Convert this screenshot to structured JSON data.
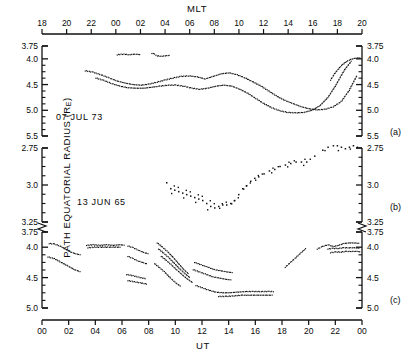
{
  "figure": {
    "top_axis_title": "MLT",
    "bottom_axis_title": "UT",
    "y_axis_title_main": "PATH EQUATORIAL RADIUS (R",
    "y_axis_title_sub": "E",
    "y_axis_title_tail": ")"
  },
  "panels": [
    {
      "tag": "(a)",
      "annotation": "07 JUL 73"
    },
    {
      "tag": "(b)",
      "annotation": "13 JUN 65"
    },
    {
      "tag": "(c)",
      "annotation": ""
    }
  ],
  "chart_data": {
    "type": "scatter",
    "title": "",
    "xlabel": "UT",
    "xlabel_top": "MLT",
    "ylabel": "PATH EQUATORIAL RADIUS (RE)",
    "grid": false,
    "legend": "none",
    "top_axis": {
      "label": "MLT",
      "ticks": [
        "18",
        "20",
        "22",
        "00",
        "02",
        "04",
        "06",
        "08",
        "10",
        "12",
        "14",
        "16",
        "18",
        "20"
      ],
      "range": [
        18,
        44
      ]
    },
    "bottom_axis": {
      "label": "UT",
      "ticks": [
        "00",
        "02",
        "04",
        "06",
        "08",
        "10",
        "12",
        "14",
        "16",
        "18",
        "20",
        "22",
        "00"
      ],
      "range": [
        0,
        24
      ]
    },
    "subplots": [
      {
        "tag": "(a)",
        "annotation": "07 JUL 73",
        "ylim": [
          5.5,
          3.75
        ],
        "yticks": [
          3.75,
          4.0,
          4.5,
          5.0,
          5.5
        ],
        "ytick_labels": [
          "3.75",
          "4.0",
          "4.5",
          "5.0",
          "5.5"
        ],
        "yminor": [
          4.125,
          4.25,
          4.375,
          4.625,
          4.75,
          4.875,
          5.125,
          5.25,
          5.375
        ],
        "series": [
          {
            "name": "upper-fragment-1",
            "x": [
              5.6,
              5.9,
              6.2,
              6.5,
              6.8,
              7.1,
              7.4
            ],
            "y": [
              3.91,
              3.9,
              3.9,
              3.91,
              3.9,
              3.9,
              3.91
            ]
          },
          {
            "name": "upper-fragment-2",
            "x": [
              8.2,
              8.4,
              8.6,
              8.9,
              9.2,
              9.6
            ],
            "y": [
              3.88,
              3.9,
              3.93,
              3.94,
              3.93,
              3.92
            ]
          },
          {
            "name": "main-trace-upper",
            "x": [
              3.2,
              3.8,
              4.4,
              5.0,
              5.6,
              6.2,
              6.8,
              7.4,
              8.0,
              8.6,
              9.2,
              9.8,
              10.4,
              11.0,
              11.6,
              12.2,
              12.8,
              13.4,
              14.0,
              14.6,
              15.2,
              15.8,
              16.4,
              17.0,
              17.6,
              18.2,
              18.8,
              19.4,
              20.0,
              20.6,
              21.2,
              21.8,
              22.4,
              23.0,
              23.6
            ],
            "y": [
              4.22,
              4.25,
              4.3,
              4.36,
              4.42,
              4.46,
              4.49,
              4.5,
              4.48,
              4.44,
              4.4,
              4.36,
              4.33,
              4.32,
              4.34,
              4.38,
              4.33,
              4.28,
              4.26,
              4.3,
              4.36,
              4.44,
              4.52,
              4.62,
              4.72,
              4.8,
              4.86,
              4.92,
              4.96,
              4.98,
              4.97,
              4.92,
              4.82,
              4.6,
              4.3
            ]
          },
          {
            "name": "main-trace-lower",
            "x": [
              4.0,
              4.6,
              5.2,
              5.8,
              6.4,
              7.0,
              7.6,
              8.2,
              8.8,
              9.4,
              10.0,
              10.6,
              11.2,
              11.8,
              12.4,
              13.0,
              13.6,
              14.2,
              14.8,
              15.4,
              16.0,
              16.6,
              17.2,
              17.8,
              18.4,
              19.0,
              19.6,
              20.2,
              20.8,
              21.4,
              22.0,
              22.6,
              23.2
            ],
            "y": [
              4.36,
              4.41,
              4.47,
              4.52,
              4.55,
              4.56,
              4.56,
              4.54,
              4.52,
              4.5,
              4.5,
              4.52,
              4.56,
              4.58,
              4.56,
              4.52,
              4.5,
              4.52,
              4.58,
              4.66,
              4.76,
              4.86,
              4.94,
              5.0,
              5.03,
              5.04,
              5.03,
              4.99,
              4.9,
              4.74,
              4.5,
              4.22,
              4.02
            ]
          },
          {
            "name": "late-rise-cluster",
            "x": [
              21.6,
              21.9,
              22.2,
              22.5,
              22.8,
              23.1,
              23.4,
              23.7,
              23.9
            ],
            "y": [
              4.4,
              4.28,
              4.18,
              4.1,
              4.04,
              4.0,
              3.98,
              3.97,
              3.98
            ]
          }
        ]
      },
      {
        "tag": "(b)",
        "annotation": "13 JUN 65",
        "ylim": [
          3.25,
          2.75
        ],
        "yticks": [
          2.75,
          3.0,
          3.25
        ],
        "ytick_labels": [
          "2.75",
          "3.0",
          "3.25"
        ],
        "yminor": [
          2.8125,
          2.875,
          2.9375,
          3.0625,
          3.125,
          3.1875
        ],
        "series": [
          {
            "name": "scatter-cloud",
            "x": [
              9.3,
              9.6,
              9.9,
              10.2,
              10.5,
              10.8,
              11.1,
              11.4,
              11.7,
              12.0,
              12.3,
              12.6,
              12.9,
              13.2,
              13.5,
              13.8,
              14.1,
              14.4,
              14.7,
              15.0,
              15.3,
              15.6,
              15.9,
              16.2,
              16.6,
              17.0,
              17.4,
              17.8,
              18.2,
              18.6,
              19.0,
              19.4,
              19.8,
              20.4,
              21.0,
              21.4,
              21.8,
              22.1,
              22.4,
              22.7,
              23.0,
              23.3,
              23.6
            ],
            "y": [
              2.98,
              3.02,
              3.03,
              3.04,
              3.05,
              3.06,
              3.07,
              3.08,
              3.09,
              3.1,
              3.12,
              3.14,
              3.15,
              3.14,
              3.13,
              3.13,
              3.12,
              3.1,
              3.06,
              3.02,
              3.0,
              2.97,
              2.95,
              2.94,
              2.92,
              2.9,
              2.89,
              2.87,
              2.86,
              2.85,
              2.84,
              2.84,
              2.84,
              2.8,
              2.76,
              2.74,
              2.73,
              2.73,
              2.74,
              2.75,
              2.74,
              2.73,
              2.74
            ]
          }
        ]
      },
      {
        "tag": "(c)",
        "annotation": "",
        "ylim": [
          5.0,
          3.75
        ],
        "yticks": [
          3.75,
          4.0,
          4.5,
          5.0
        ],
        "ytick_labels": [
          "3.75",
          "4.0",
          "4.5",
          "5.0"
        ],
        "yminor": [
          4.125,
          4.25,
          4.375,
          4.625,
          4.75,
          4.875
        ],
        "series": [
          {
            "name": "seg-a-upper",
            "x": [
              0.5,
              0.9,
              1.3,
              1.7,
              2.1,
              2.5,
              2.9
            ],
            "y": [
              3.93,
              3.94,
              3.97,
              4.02,
              4.07,
              4.1,
              4.12
            ]
          },
          {
            "name": "seg-a-lower",
            "x": [
              0.4,
              0.9,
              1.4,
              1.9,
              2.4,
              2.9
            ],
            "y": [
              4.15,
              4.18,
              4.24,
              4.3,
              4.36,
              4.4
            ]
          },
          {
            "name": "seg-b-flat",
            "x": [
              3.3,
              3.8,
              4.3,
              4.8,
              5.3,
              5.8,
              6.2
            ],
            "y": [
              3.96,
              3.95,
              3.96,
              3.95,
              3.96,
              3.95,
              3.96
            ]
          },
          {
            "name": "seg-b-mid",
            "x": [
              3.4,
              3.9,
              4.4,
              4.9,
              5.4,
              5.9
            ],
            "y": [
              4.0,
              3.99,
              3.99,
              3.99,
              3.99,
              3.99
            ]
          },
          {
            "name": "seg-c-upper",
            "x": [
              6.4,
              6.8,
              7.2,
              7.6,
              8.0
            ],
            "y": [
              3.97,
              4.0,
              4.04,
              4.08,
              4.1
            ]
          },
          {
            "name": "seg-c-mid",
            "x": [
              6.4,
              6.8,
              7.2,
              7.6,
              7.9
            ],
            "y": [
              4.14,
              4.18,
              4.22,
              4.25,
              4.27
            ]
          },
          {
            "name": "seg-c-lower",
            "x": [
              6.3,
              6.8,
              7.3,
              7.8
            ],
            "y": [
              4.44,
              4.46,
              4.49,
              4.51
            ]
          },
          {
            "name": "seg-c-lower2",
            "x": [
              6.4,
              6.9,
              7.4,
              7.9
            ],
            "y": [
              4.54,
              4.56,
              4.58,
              4.6
            ]
          },
          {
            "name": "seg-d-1",
            "x": [
              8.6,
              9.0,
              9.4,
              9.8,
              10.2,
              10.6,
              11.0
            ],
            "y": [
              3.92,
              3.99,
              4.07,
              4.16,
              4.26,
              4.36,
              4.44
            ]
          },
          {
            "name": "seg-d-2",
            "x": [
              8.7,
              9.1,
              9.5,
              9.9,
              10.3,
              10.7,
              11.1
            ],
            "y": [
              4.02,
              4.09,
              4.17,
              4.26,
              4.35,
              4.43,
              4.5
            ]
          },
          {
            "name": "seg-d-3",
            "x": [
              8.9,
              9.3,
              9.7,
              10.1,
              10.5,
              10.9,
              11.3
            ],
            "y": [
              4.14,
              4.21,
              4.29,
              4.37,
              4.45,
              4.52,
              4.58
            ]
          },
          {
            "name": "seg-d-4",
            "x": [
              8.4,
              8.8,
              9.2,
              9.6,
              10.0,
              10.4
            ],
            "y": [
              4.26,
              4.33,
              4.41,
              4.5,
              4.58,
              4.64
            ]
          },
          {
            "name": "seg-e-upper",
            "x": [
              11.4,
              11.9,
              12.4,
              12.9,
              13.4,
              13.9,
              14.3
            ],
            "y": [
              4.24,
              4.28,
              4.32,
              4.36,
              4.38,
              4.4,
              4.41
            ]
          },
          {
            "name": "seg-e-mid",
            "x": [
              11.3,
              11.8,
              12.3,
              12.8,
              13.3,
              13.8,
              14.2
            ],
            "y": [
              4.36,
              4.4,
              4.44,
              4.48,
              4.5,
              4.52,
              4.53
            ]
          },
          {
            "name": "seg-e-low",
            "x": [
              11.5,
              12.0,
              12.5,
              13.0,
              13.5,
              14.0,
              14.6,
              15.2,
              15.8,
              16.4,
              17.0,
              17.4
            ],
            "y": [
              4.62,
              4.66,
              4.7,
              4.73,
              4.74,
              4.74,
              4.73,
              4.72,
              4.72,
              4.72,
              4.72,
              4.72
            ]
          },
          {
            "name": "seg-e-low2",
            "x": [
              13.2,
              13.8,
              14.4,
              15.0,
              15.6,
              16.2,
              16.8,
              17.3
            ],
            "y": [
              4.8,
              4.8,
              4.79,
              4.78,
              4.78,
              4.78,
              4.78,
              4.78
            ]
          },
          {
            "name": "seg-f-rise",
            "x": [
              18.2,
              18.6,
              19.0,
              19.4,
              19.8
            ],
            "y": [
              4.32,
              4.24,
              4.16,
              4.08,
              4.0
            ]
          },
          {
            "name": "seg-g-upper",
            "x": [
              20.6,
              21.0,
              21.4,
              21.8,
              22.2,
              22.6,
              23.0,
              23.4,
              23.8
            ],
            "y": [
              4.02,
              3.98,
              3.95,
              3.98,
              3.96,
              3.93,
              3.92,
              3.92,
              3.93
            ]
          },
          {
            "name": "seg-g-mid",
            "x": [
              21.4,
              21.8,
              22.2,
              22.6,
              23.0,
              23.4,
              23.8
            ],
            "y": [
              4.02,
              4.01,
              4.01,
              4.0,
              4.0,
              4.0,
              4.01
            ]
          },
          {
            "name": "seg-g-low",
            "x": [
              21.6,
              22.0,
              22.4,
              22.8,
              23.2,
              23.6,
              23.9
            ],
            "y": [
              4.08,
              4.07,
              4.07,
              4.06,
              4.06,
              4.06,
              4.07
            ]
          }
        ]
      }
    ]
  }
}
